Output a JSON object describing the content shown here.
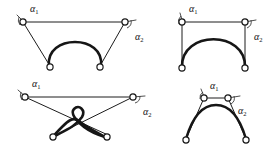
{
  "figure": {
    "background_color": "#ffffff",
    "line_color": "#1c1c1c",
    "label_color": "#111111",
    "width": 278,
    "height": 153
  },
  "labels": {
    "alpha": "α",
    "sub_one": "1",
    "sub_two": "2"
  },
  "panels": [
    {
      "id": "top-left",
      "name": "trapezoid-arc-diagram",
      "alpha1_label": "α",
      "alpha1_sub": "1",
      "alpha2_label": "α",
      "alpha2_sub": "2",
      "node_count": 4,
      "description": "Two upper nodes joined by a long horizontal chord; thin legs splay down to two lower nodes; a thick semicircular arc spans between the lower nodes."
    },
    {
      "id": "top-right",
      "name": "rectangle-arc-diagram",
      "alpha1_label": "α",
      "alpha1_sub": "1",
      "alpha2_label": "α",
      "alpha2_sub": "2",
      "node_count": 4,
      "description": "Rectangular frame of thin edges with a thick semicircular arc rising between the two lower nodes."
    },
    {
      "id": "bottom-left",
      "name": "crossed-loop-diagram",
      "alpha1_label": "α",
      "alpha1_sub": "1",
      "alpha2_label": "α",
      "alpha2_sub": "2",
      "node_count": 4,
      "description": "Upper horizontal chord with thin legs crossing diagonally; two thick curves cross and form a small loop above the crossing point."
    },
    {
      "id": "bottom-right",
      "name": "peaked-arc-diagram",
      "alpha1_label": "α",
      "alpha1_sub": "1",
      "alpha2_label": "α",
      "alpha2_sub": "2",
      "node_count": 4,
      "description": "Two close upper nodes joined by a short horizontal segment; thin legs descend to widely spaced lower nodes; a thick peaked arc spans the lower nodes."
    }
  ]
}
